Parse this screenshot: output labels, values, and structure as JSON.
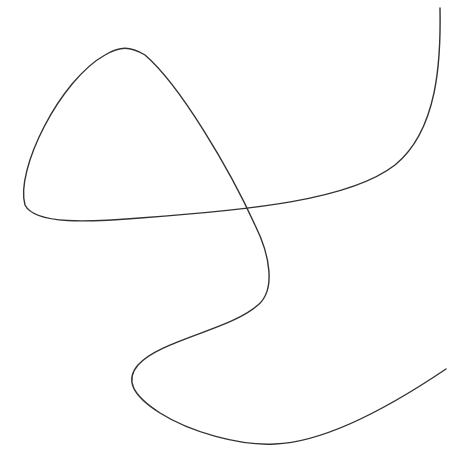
{
  "canvas": {
    "width": 464,
    "height": 466,
    "background": "#ffffff"
  },
  "stroke": {
    "color": "#333333",
    "width": 1.4
  },
  "curve": {
    "description": "single continuous hand-drawn line forming a loop with a crossing, an S-bend and an open tail",
    "path": "M 440 8 C 441 60, 438 130, 395 165 C 350 200, 250 210, 140 218 C 90 222, 35 225, 25 205 C 15 170, 60 80, 105 55 C 120 46, 130 46, 145 55 C 180 85, 230 170, 255 225 C 270 255, 276 290, 258 305 C 230 330, 160 340, 138 365 C 125 380, 132 395, 160 413 C 190 432, 240 446, 275 444 C 330 442, 400 400, 446 369",
    "points": {
      "start": [
        440,
        8
      ],
      "right_bend": [
        395,
        165
      ],
      "left_corner": [
        25,
        210
      ],
      "peak": [
        120,
        48
      ],
      "self_intersection": [
        249,
        212
      ],
      "s_bend_right": [
        271,
        278
      ],
      "left_bulge": [
        130,
        378
      ],
      "bottom": [
        270,
        444
      ],
      "end": [
        446,
        369
      ]
    }
  },
  "top_edge_text": {
    "note": "only clipped descender fragments visible",
    "text": ""
  }
}
